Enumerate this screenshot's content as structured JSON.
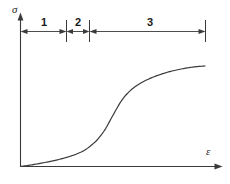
{
  "figure": {
    "background_color": "#ffffff",
    "line_color": "#3a3a3a",
    "axes": {
      "y_axis_label": "σ",
      "x_axis_label": "ε",
      "y_axis_name": "stress",
      "x_axis_name": "strain"
    },
    "regions": [
      {
        "label": "1",
        "start": 0.0,
        "end": 0.43
      },
      {
        "label": "2",
        "start": 0.43,
        "end": 0.55
      },
      {
        "label": "3",
        "start": 0.55,
        "end": 1.0
      }
    ]
  },
  "chart_data": {
    "type": "line",
    "xlabel": "ε",
    "ylabel": "σ",
    "xlim": [
      0,
      1
    ],
    "ylim": [
      0,
      1
    ],
    "grid": false,
    "legend": null,
    "series": [
      {
        "name": "stress-strain curve",
        "x": [
          0.0,
          0.05,
          0.1,
          0.15,
          0.2,
          0.25,
          0.3,
          0.35,
          0.4,
          0.43,
          0.46,
          0.5,
          0.55,
          0.6,
          0.65,
          0.7,
          0.75,
          0.8,
          0.85,
          0.9,
          0.95,
          1.0
        ],
        "y": [
          0.0,
          0.012,
          0.026,
          0.042,
          0.06,
          0.082,
          0.11,
          0.15,
          0.215,
          0.27,
          0.34,
          0.46,
          0.6,
          0.69,
          0.748,
          0.79,
          0.822,
          0.848,
          0.868,
          0.884,
          0.895,
          0.902
        ]
      }
    ],
    "annotations": [
      {
        "text": "1",
        "x_start": 0.0,
        "x_end": 0.43,
        "kind": "dimension-span"
      },
      {
        "text": "2",
        "x_start": 0.43,
        "x_end": 0.55,
        "kind": "dimension-span"
      },
      {
        "text": "3",
        "x_start": 0.55,
        "x_end": 1.0,
        "kind": "dimension-span"
      }
    ],
    "axis_ticks": {
      "x": [],
      "y": []
    }
  }
}
